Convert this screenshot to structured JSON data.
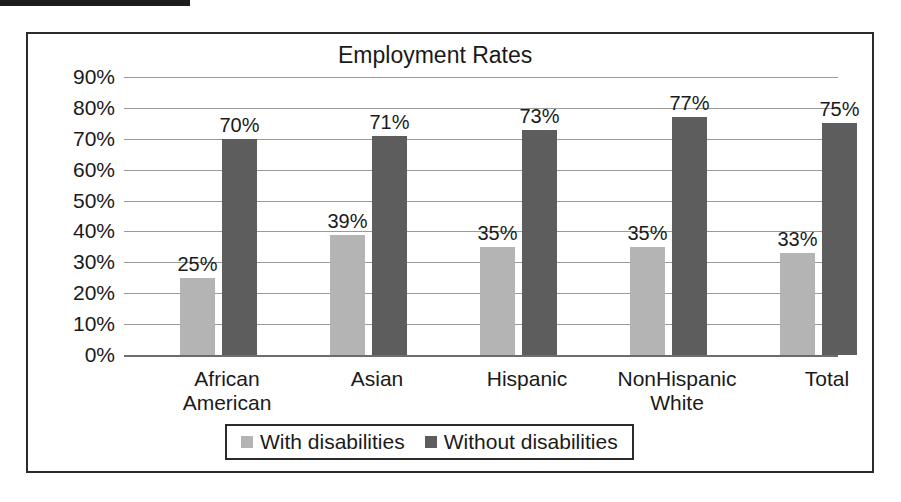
{
  "page": {
    "redaction_bar": "redacted-text-block"
  },
  "chart_data": {
    "type": "bar",
    "title": "Employment Rates",
    "xlabel": "",
    "ylabel": "",
    "ylim": [
      0,
      90
    ],
    "grid": true,
    "legend_position": "bottom",
    "ytick_labels": [
      "90%",
      "80%",
      "70%",
      "60%",
      "50%",
      "40%",
      "30%",
      "20%",
      "10%",
      "0%"
    ],
    "ytick_values": [
      90,
      80,
      70,
      60,
      50,
      40,
      30,
      20,
      10,
      0
    ],
    "categories": [
      "African American",
      "Asian",
      "Hispanic",
      "NonHispanic White",
      "Total"
    ],
    "category_lines": [
      [
        "African",
        "American"
      ],
      [
        "Asian"
      ],
      [
        "Hispanic"
      ],
      [
        "NonHispanic",
        "White"
      ],
      [
        "Total"
      ]
    ],
    "series": [
      {
        "name": "With disabilities",
        "color": "#b4b4b4",
        "values": [
          25,
          39,
          35,
          35,
          33
        ],
        "labels": [
          "25%",
          "39%",
          "35%",
          "35%",
          "33%"
        ]
      },
      {
        "name": "Without disabilities",
        "color": "#5d5d5d",
        "values": [
          70,
          71,
          73,
          77,
          75
        ],
        "labels": [
          "70%",
          "71%",
          "73%",
          "77%",
          "75%"
        ]
      }
    ]
  }
}
